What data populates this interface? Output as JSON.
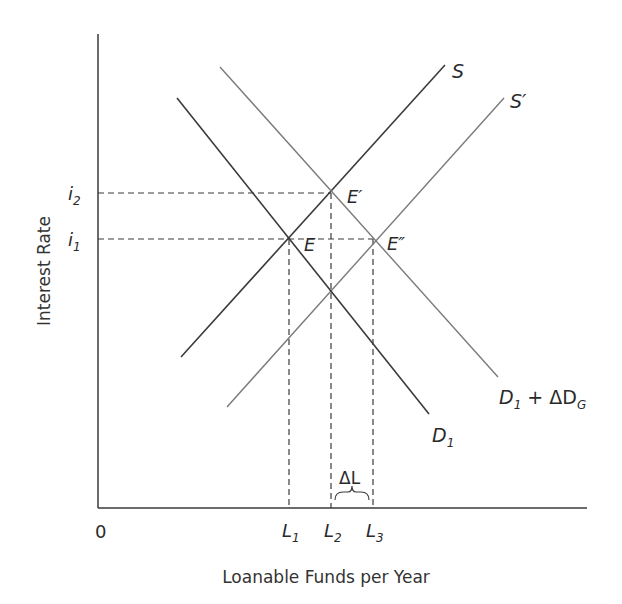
{
  "chart_data": {
    "type": "line",
    "title": "",
    "xlabel": "Loanable Funds per Year",
    "ylabel": "Interest Rate",
    "origin_label": "0",
    "series": [
      {
        "name": "S",
        "label": "S",
        "kind": "supply",
        "color": "#3a3a3a",
        "x1": 181,
        "y1": 357,
        "x2": 445,
        "y2": 65
      },
      {
        "name": "S'",
        "label": "S′",
        "kind": "supply",
        "color": "#7a7a7a",
        "x1": 227,
        "y1": 407,
        "x2": 504,
        "y2": 98
      },
      {
        "name": "D1",
        "label": "D₁",
        "kind": "demand",
        "color": "#3a3a3a",
        "x1": 177,
        "y1": 98,
        "x2": 429,
        "y2": 414
      },
      {
        "name": "D1 + ΔDG",
        "label": "D₁ + ΔD_G",
        "kind": "demand",
        "color": "#7a7a7a",
        "x1": 220,
        "y1": 67,
        "x2": 498,
        "y2": 377
      }
    ],
    "points": [
      {
        "name": "E",
        "x": 289,
        "y": 239
      },
      {
        "name": "E'",
        "x": 331,
        "y": 193
      },
      {
        "name": "E''",
        "x": 373,
        "y": 239
      }
    ],
    "y_ticks": [
      "i1",
      "i2"
    ],
    "x_ticks": [
      "L1",
      "L2",
      "L3"
    ],
    "annotations": [
      "ΔL"
    ]
  },
  "labels": {
    "y_axis_title": "Interest Rate",
    "x_axis_title": "Loanable Funds per Year",
    "origin": "0",
    "i2_main": "i",
    "i2_sub": "2",
    "i1_main": "i",
    "i1_sub": "1",
    "L1_main": "L",
    "L1_sub": "1",
    "L2_main": "L",
    "L2_sub": "2",
    "L3_main": "L",
    "L3_sub": "3",
    "S": "S",
    "S_prime": "S′",
    "E": "E",
    "E_prime": "E′",
    "E_double_prime": "E″",
    "D1_main": "D",
    "D1_sub": "1",
    "DG_main": "D",
    "DG_sub": "1",
    "DG_plus": " + ΔD",
    "DG_sub2": "G",
    "delta_L": "ΔL"
  }
}
